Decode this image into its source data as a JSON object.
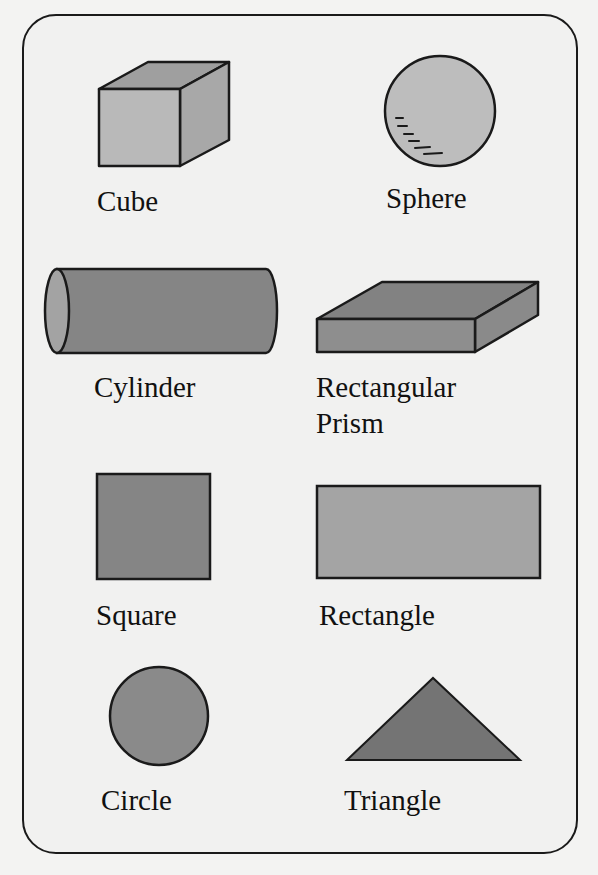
{
  "colors": {
    "background": "#f3f3f2",
    "card_fill": "#f1f1f0",
    "outline": "#1a1a1a",
    "light_gray": "#b9b9b9",
    "mid_gray": "#8f8f8f",
    "dark_gray": "#7a7a7a"
  },
  "shapes": [
    {
      "id": "cube",
      "label": "Cube",
      "dimension": "3D"
    },
    {
      "id": "sphere",
      "label": "Sphere",
      "dimension": "3D"
    },
    {
      "id": "cylinder",
      "label": "Cylinder",
      "dimension": "3D"
    },
    {
      "id": "rectangular-prism",
      "label": "Rectangular\nPrism",
      "dimension": "3D"
    },
    {
      "id": "square",
      "label": "Square",
      "dimension": "2D"
    },
    {
      "id": "rectangle",
      "label": "Rectangle",
      "dimension": "2D"
    },
    {
      "id": "circle",
      "label": "Circle",
      "dimension": "2D"
    },
    {
      "id": "triangle",
      "label": "Triangle",
      "dimension": "2D"
    }
  ]
}
